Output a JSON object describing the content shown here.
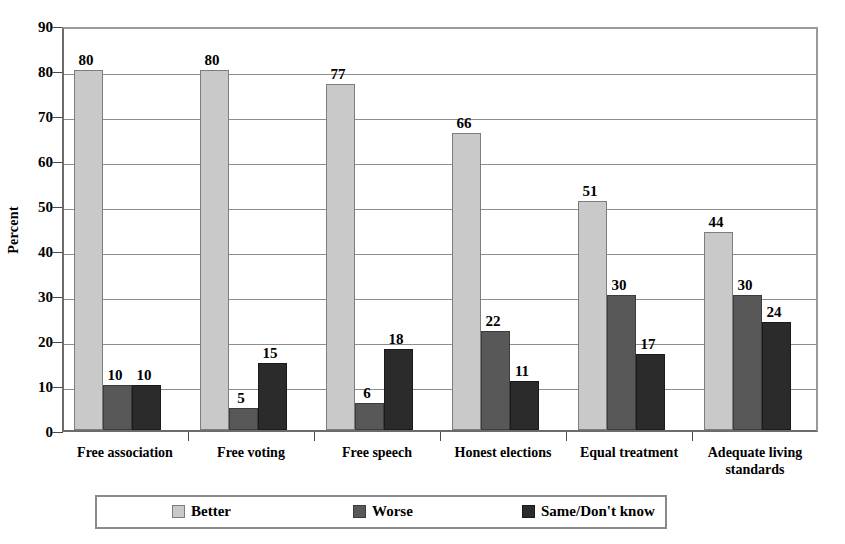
{
  "chart_data": {
    "type": "bar",
    "title": "",
    "xlabel": "",
    "ylabel": "Percent",
    "ylim": [
      0,
      90
    ],
    "ytick_step": 10,
    "yticks": [
      0,
      10,
      20,
      30,
      40,
      50,
      60,
      70,
      80,
      90
    ],
    "grid": true,
    "legend_position": "bottom",
    "categories": [
      "Free association",
      "Free voting",
      "Free speech",
      "Honest elections",
      "Equal treatment",
      "Adequate living standards"
    ],
    "series": [
      {
        "name": "Better",
        "color": "#c9c9c9",
        "values": [
          80,
          80,
          77,
          66,
          51,
          44
        ]
      },
      {
        "name": "Worse",
        "color": "#585858",
        "values": [
          10,
          5,
          6,
          22,
          30,
          30
        ]
      },
      {
        "name": "Same/Don't know",
        "color": "#2b2b2b",
        "values": [
          10,
          15,
          18,
          11,
          17,
          24
        ]
      }
    ]
  },
  "axis": {
    "y_title": "Percent"
  },
  "legend": {
    "items": [
      "Better",
      "Worse",
      "Same/Don't know"
    ]
  },
  "artifact": {
    "text": ""
  }
}
